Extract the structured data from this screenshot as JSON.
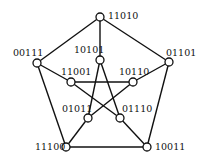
{
  "diagram": {
    "type": "petersen-graph",
    "colors": {
      "stroke": "#111111",
      "node_fill": "#ffffff",
      "background": "#ffffff"
    },
    "nodes": [
      {
        "id": "11010",
        "label": "11010",
        "x": 100,
        "y": 17,
        "lx": 108,
        "ly": 19,
        "anchor": "start"
      },
      {
        "id": "00111",
        "label": "00111",
        "x": 37,
        "y": 63,
        "lx": 13,
        "ly": 56,
        "anchor": "start"
      },
      {
        "id": "01101",
        "label": "01101",
        "x": 169,
        "y": 62,
        "lx": 166,
        "ly": 56,
        "anchor": "start"
      },
      {
        "id": "11100",
        "label": "11100",
        "x": 66,
        "y": 147,
        "lx": 35,
        "ly": 150,
        "anchor": "start"
      },
      {
        "id": "10011",
        "label": "10011",
        "x": 147,
        "y": 147,
        "lx": 155,
        "ly": 150,
        "anchor": "start"
      },
      {
        "id": "10101",
        "label": "10101",
        "x": 100,
        "y": 60,
        "lx": 74,
        "ly": 53,
        "anchor": "start"
      },
      {
        "id": "11001",
        "label": "11001",
        "x": 71,
        "y": 82,
        "lx": 61,
        "ly": 75,
        "anchor": "start"
      },
      {
        "id": "10110",
        "label": "10110",
        "x": 133,
        "y": 82,
        "lx": 119,
        "ly": 75,
        "anchor": "start"
      },
      {
        "id": "01011",
        "label": "01011",
        "x": 88,
        "y": 118,
        "lx": 62,
        "ly": 112,
        "anchor": "start"
      },
      {
        "id": "01110",
        "label": "01110",
        "x": 120,
        "y": 118,
        "lx": 122,
        "ly": 112,
        "anchor": "start"
      }
    ],
    "edges": [
      [
        "11010",
        "01101"
      ],
      [
        "01101",
        "10011"
      ],
      [
        "10011",
        "11100"
      ],
      [
        "11100",
        "00111"
      ],
      [
        "00111",
        "11010"
      ],
      [
        "11010",
        "10101"
      ],
      [
        "00111",
        "11001"
      ],
      [
        "01101",
        "10110"
      ],
      [
        "11100",
        "01011"
      ],
      [
        "10011",
        "01110"
      ],
      [
        "10101",
        "01011"
      ],
      [
        "10101",
        "01110"
      ],
      [
        "11001",
        "10110"
      ],
      [
        "11001",
        "01110"
      ],
      [
        "10110",
        "01011"
      ]
    ],
    "node_radius": 4
  }
}
